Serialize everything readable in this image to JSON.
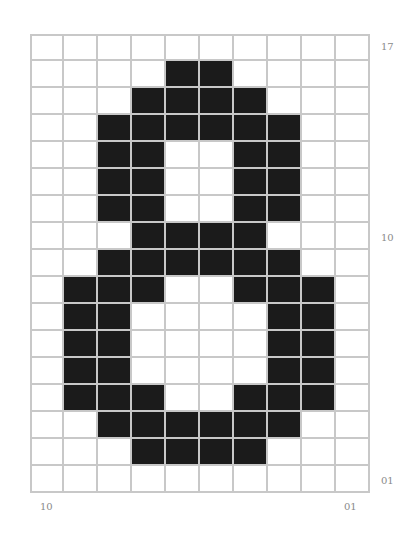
{
  "figure": {
    "rows": 17,
    "cols": 10,
    "fill_color": "#1b1b1b",
    "empty_color": "#ffffff",
    "grid_line_color": "#c8c8c8",
    "label_color": "#8a8a8a",
    "bitmap": [
      "0000000000",
      "0000110000",
      "0001111000",
      "0011111100",
      "0011001100",
      "0011001100",
      "0011001100",
      "0001111000",
      "0011111100",
      "0111001110",
      "0110000110",
      "0110000110",
      "0110000110",
      "0111001110",
      "0011111100",
      "0001111000",
      "0000000000"
    ]
  },
  "labels": {
    "right_top": "17",
    "right_middle": "10",
    "right_bottom": "01",
    "bottom_left": "10",
    "bottom_right": "01"
  }
}
